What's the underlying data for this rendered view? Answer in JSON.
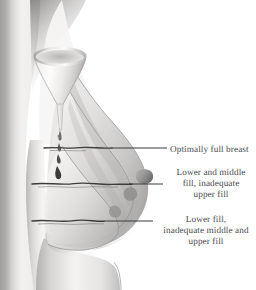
{
  "figure": {
    "type": "anatomical-illustration",
    "view": "lateral profile",
    "palette": {
      "background": "#ffffff",
      "skin_light": "#f6f5f4",
      "skin_mid": "#c9c7c6",
      "skin_shadow": "#8d8b8a",
      "skin_dark": "#5e5c5b",
      "contour_line": "#3d3c3c",
      "leader_line": "#3a3a3c",
      "label_text": "#4a4a4f",
      "funnel_light": "#fbfaf9",
      "funnel_shade": "#b5b3b1"
    }
  },
  "callouts": [
    {
      "id": "optimal",
      "text": "Optimally full breast",
      "leader": {
        "x1": 112,
        "y1": 148,
        "x2": 167,
        "y2": 148
      },
      "anchor_level": "upper"
    },
    {
      "id": "lower-middle",
      "text": "Lower and middle\nfill, inadequate\nupper fill",
      "leader": {
        "x1": 129,
        "y1": 184,
        "x2": 163,
        "y2": 184
      },
      "anchor_level": "middle"
    },
    {
      "id": "lower",
      "text": "Lower fill,\ninadequate middle and\nupper fill",
      "leader": {
        "x1": 104,
        "y1": 221,
        "x2": 153,
        "y2": 221
      },
      "anchor_level": "lower"
    }
  ],
  "fill_levels": [
    {
      "id": "upper-fill-line",
      "name": "Upper fill level",
      "y": 148
    },
    {
      "id": "middle-fill-line",
      "name": "Middle fill level",
      "y": 184
    },
    {
      "id": "lower-fill-line",
      "name": "Lower fill level",
      "y": 221
    }
  ],
  "elements": {
    "torso": "torso-profile",
    "funnel": "funnel-icon",
    "droplets": "droplet-stream",
    "breast_outer": "breast-contour-optimal",
    "breast_middle": "breast-contour-middle",
    "breast_inner": "breast-contour-lower",
    "nipple": "nipple-profile"
  }
}
